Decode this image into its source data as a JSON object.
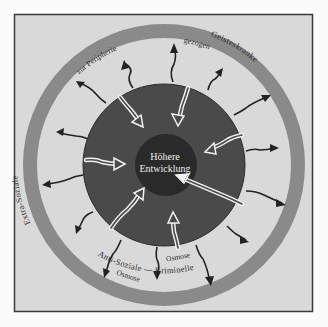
{
  "diagram": {
    "center_label_line1": "Höhere",
    "center_label_line2": "Entwicklung",
    "outer_ring_top_right": "Geisteskranke",
    "outer_ring_left": "Extra-Soziale",
    "outer_ring_bottom": "Anti-Soziale — Kriminelle",
    "periphery_label_left": "zur Peripherie",
    "periphery_label_right": "gezogen",
    "osmose_label_right": "Osmose",
    "osmose_label_left": "Osmose",
    "colors": {
      "background": "#d9d9d9",
      "frame": "#3a3a3a",
      "outer_ring": "#8a8a8a",
      "middle_disc": "#4a4a4a",
      "inner_core": "#2a2a2a",
      "arrow_dark": "#222222",
      "arrow_light": "#f2f2f2",
      "text_light": "#eeeeee",
      "text_dark": "#2a2a2a"
    }
  }
}
